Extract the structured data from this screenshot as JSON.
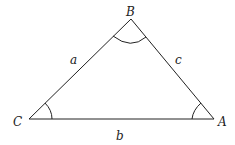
{
  "diagram": {
    "type": "triangle",
    "vertices": [
      {
        "label": "A",
        "x": 214,
        "y": 119
      },
      {
        "label": "B",
        "x": 131,
        "y": 19
      },
      {
        "label": "C",
        "x": 29,
        "y": 119
      }
    ],
    "sides": [
      {
        "label": "a",
        "between": [
          "B",
          "C"
        ]
      },
      {
        "label": "b",
        "between": [
          "C",
          "A"
        ]
      },
      {
        "label": "c",
        "between": [
          "A",
          "B"
        ]
      }
    ],
    "angle_arcs": [
      "A",
      "B",
      "C"
    ],
    "line_color": "#222222"
  }
}
